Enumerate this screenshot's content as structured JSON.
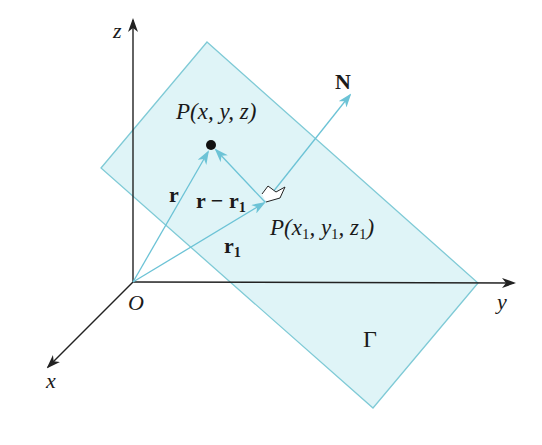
{
  "diagram": {
    "colors": {
      "plane_fill": "#dff4f7",
      "plane_edge": "#7fcad6",
      "vector": "#6cc3d6",
      "axis": "#222222",
      "point": "#111111"
    },
    "axes": {
      "z_label": "z",
      "y_label": "y",
      "x_label": "x",
      "origin_label": "O"
    },
    "points": {
      "P_label": "P(x, y, z)",
      "P1_label": "P(x",
      "P1_sub1": "1",
      "P1_mid1": ", y",
      "P1_sub2": "1",
      "P1_mid2": ", z",
      "P1_sub3": "1",
      "P1_end": ")"
    },
    "vectors": {
      "r_label": "r",
      "r_minus_r1_label": "r − r",
      "r_minus_r1_sub": "1",
      "r1_label": "r",
      "r1_sub": "1",
      "normal_label": "N"
    },
    "plane_label": "Γ"
  }
}
